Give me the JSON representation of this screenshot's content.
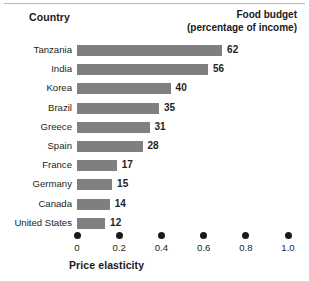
{
  "header": {
    "country_label": "Country",
    "budget_label_line1": "Food budget",
    "budget_label_line2": "(percentage of income)"
  },
  "axis": {
    "title": "Price elasticity"
  },
  "style": {
    "bar_color": "#7f7f7f",
    "text_color": "#231f20",
    "dot_color": "#1a1a1a",
    "background": "#ffffff"
  },
  "chart_data": {
    "type": "bar",
    "orientation": "horizontal",
    "title": "",
    "subtitle": "",
    "xlabel": "Price elasticity",
    "ylabel": "Country",
    "value_label": "Food budget (percentage of income)",
    "categories": [
      "Tanzania",
      "India",
      "Korea",
      "Brazil",
      "Greece",
      "Spain",
      "France",
      "Germany",
      "Canada",
      "United States"
    ],
    "values": [
      62,
      56,
      40,
      35,
      31,
      28,
      17,
      15,
      14,
      12
    ],
    "x": [
      0.955,
      0.865,
      0.6,
      0.52,
      0.465,
      0.41,
      0.235,
      0.205,
      0.19,
      0.16
    ],
    "xticks": [
      0,
      0.2,
      0.4,
      0.6,
      0.8,
      1.0
    ],
    "xticklabels": [
      "0",
      "0.2",
      "0.4",
      "0.6",
      "0.8",
      "1.0"
    ],
    "xlim": [
      0,
      1.0
    ],
    "grid": false,
    "legend": false,
    "tick_marker": "dot"
  }
}
